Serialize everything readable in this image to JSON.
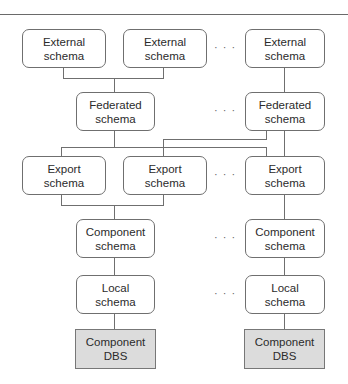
{
  "diagram": {
    "type": "five-level schema architecture for federated database system",
    "ellipsis": "· · ·",
    "levels": [
      {
        "name": "external",
        "boxes": [
          {
            "line1": "External",
            "line2": "schema"
          },
          {
            "line1": "External",
            "line2": "schema"
          },
          {
            "line1": "External",
            "line2": "schema"
          }
        ]
      },
      {
        "name": "federated",
        "boxes": [
          {
            "line1": "Federated",
            "line2": "schema"
          },
          {
            "line1": "Federated",
            "line2": "schema"
          }
        ]
      },
      {
        "name": "export",
        "boxes": [
          {
            "line1": "Export",
            "line2": "schema"
          },
          {
            "line1": "Export",
            "line2": "schema"
          },
          {
            "line1": "Export",
            "line2": "schema"
          }
        ]
      },
      {
        "name": "component",
        "boxes": [
          {
            "line1": "Component",
            "line2": "schema"
          },
          {
            "line1": "Component",
            "line2": "schema"
          }
        ]
      },
      {
        "name": "local",
        "boxes": [
          {
            "line1": "Local",
            "line2": "schema"
          },
          {
            "line1": "Local",
            "line2": "schema"
          }
        ]
      },
      {
        "name": "dbs",
        "boxes": [
          {
            "line1": "Component",
            "line2": "DBS"
          },
          {
            "line1": "Component",
            "line2": "DBS"
          }
        ]
      }
    ],
    "colors": {
      "line": "#6f6f6f",
      "dbs_fill": "#dcdcdc",
      "box_fill": "#ffffff"
    }
  }
}
